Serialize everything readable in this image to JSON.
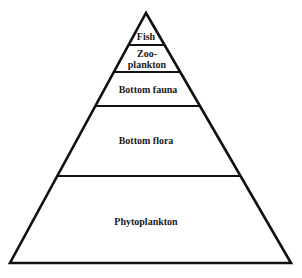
{
  "diagram": {
    "type": "trophic-pyramid",
    "colors": {
      "stroke": "#111111",
      "background": "#ffffff",
      "text": "#1a1a1a"
    },
    "levels": [
      {
        "label_lines": [
          "Fish"
        ]
      },
      {
        "label_lines": [
          "Zoo-",
          "plankton"
        ]
      },
      {
        "label_lines": [
          "Bottom fauna"
        ]
      },
      {
        "label_lines": [
          "Bottom flora"
        ]
      },
      {
        "label_lines": [
          "Phytoplankton"
        ]
      }
    ]
  }
}
